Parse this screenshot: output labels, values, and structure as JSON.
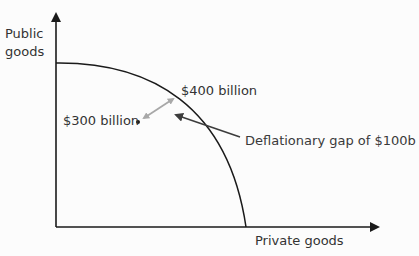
{
  "diagram": {
    "type": "production-possibility-frontier",
    "y_axis": {
      "label_line1": "Public",
      "label_line2": "goods"
    },
    "x_axis": {
      "label": "Private goods"
    },
    "points": {
      "inside": {
        "label": "$300 billion"
      },
      "frontier": {
        "label": "$400 billion"
      }
    },
    "annotation": {
      "label": "Deflationary gap of $100b"
    },
    "colors": {
      "axis": "#1a1a1a",
      "curve": "#1a1a1a",
      "gap_arrow": "#a8a8a8",
      "pointer_arrow": "#3c3c3c",
      "background": "#fcfcfc"
    }
  }
}
